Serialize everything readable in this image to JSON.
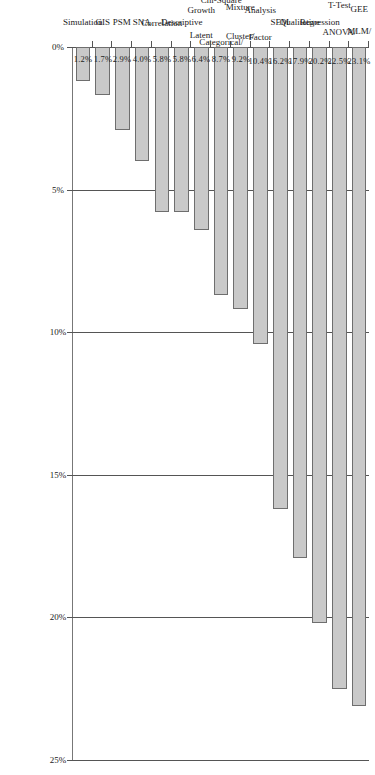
{
  "chart_data": {
    "type": "bar",
    "orientation": "horizontal",
    "title": "",
    "xlabel": "",
    "ylabel": "",
    "xlim": [
      0,
      25
    ],
    "grid": true,
    "legend": "none",
    "tick_labels": [
      "0%",
      "5%",
      "10%",
      "15%",
      "20%",
      "25%"
    ],
    "tick_values": [
      0,
      5,
      10,
      15,
      20,
      25
    ],
    "categories": [
      "MLM/ GEE",
      "ANOVA/ T-Test",
      "Regression",
      "Qualitative",
      "SEM",
      "Factor Analysis",
      "Cluster/ Mixture",
      "Categorical/ Chi-Square",
      "Latent Growth",
      "Descriptive",
      "Correlation",
      "SNA",
      "PSM",
      "GIS",
      "Simulation"
    ],
    "values": [
      23.1,
      22.5,
      20.2,
      17.9,
      16.2,
      10.4,
      9.2,
      8.7,
      6.4,
      5.8,
      5.8,
      4.0,
      2.9,
      1.7,
      1.2
    ],
    "value_labels": [
      "23.1%",
      "22.5%",
      "20.2%",
      "17.9%",
      "16.2%",
      "10.4%",
      "9.2%",
      "8.7%",
      "6.4%",
      "5.8%",
      "5.8%",
      "4.0%",
      "2.9%",
      "1.7%",
      "1.2%"
    ]
  },
  "style": {
    "bar_fill": "#c9c9c9",
    "bar_stroke": "#6e6e6e",
    "grid_color": "#555555",
    "text_color": "#1a1a1a",
    "background": "#ffffff"
  },
  "categories_lines": [
    [
      "MLM/",
      "GEE"
    ],
    [
      "ANOVA/",
      "T-Test"
    ],
    [
      "Regression"
    ],
    [
      "Qualitative"
    ],
    [
      "SEM"
    ],
    [
      "Factor",
      "Analysis"
    ],
    [
      "Cluster/",
      "Mixture"
    ],
    [
      "Categorical/",
      "Chi-Square"
    ],
    [
      "Latent",
      "Growth"
    ],
    [
      "Descriptive"
    ],
    [
      "Correlation"
    ],
    [
      "SNA"
    ],
    [
      "PSM"
    ],
    [
      "GIS"
    ],
    [
      "Simulation"
    ]
  ]
}
